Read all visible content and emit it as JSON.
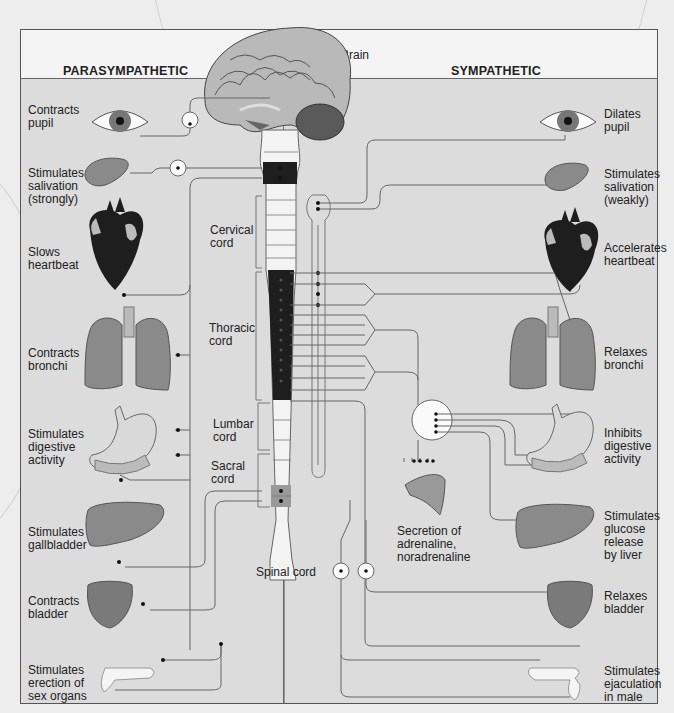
{
  "header": {
    "left_title": "PARASYMPATHETIC",
    "right_title": "SYMPATHETIC",
    "brain_label": "Brain"
  },
  "spinal_labels": {
    "cervical": "Cervical cord",
    "thoracic": "Thoracic cord",
    "lumbar": "Lumbar cord",
    "sacral": "Sacral cord",
    "spinal": "Spinal cord"
  },
  "parasympathetic": [
    {
      "organ": "eye",
      "effect": "Contracts pupil"
    },
    {
      "organ": "salivary-gland",
      "effect": "Stimulates salivation (strongly)"
    },
    {
      "organ": "heart",
      "effect": "Slows heartbeat"
    },
    {
      "organ": "lungs",
      "effect": "Contracts bronchi"
    },
    {
      "organ": "stomach",
      "effect": "Stimulates digestive activity"
    },
    {
      "organ": "liver",
      "effect": "Stimulates gallbladder"
    },
    {
      "organ": "bladder",
      "effect": "Contracts bladder"
    },
    {
      "organ": "sex-organs",
      "effect": "Stimulates erection of sex organs"
    }
  ],
  "sympathetic": [
    {
      "organ": "eye",
      "effect": "Dilates pupil"
    },
    {
      "organ": "salivary-gland",
      "effect": "Stimulates salivation (weakly)"
    },
    {
      "organ": "heart",
      "effect": "Accelerates heartbeat"
    },
    {
      "organ": "lungs",
      "effect": "Relaxes bronchi"
    },
    {
      "organ": "stomach",
      "effect": "Inhibits digestive activity"
    },
    {
      "organ": "liver",
      "effect": "Stimulates glucose release by liver"
    },
    {
      "organ": "bladder",
      "effect": "Relaxes bladder"
    },
    {
      "organ": "sex-organs",
      "effect": "Stimulates ejaculation in male"
    }
  ],
  "adrenal": {
    "label": "Secretion of adrenaline, noradrenaline"
  },
  "colors": {
    "panel": "#dcdcdc",
    "header": "#f4f4f4",
    "cord_dark": "#222222",
    "organ": "#8a8a8a",
    "heart": "#1e1e1e",
    "line": "#555555"
  }
}
